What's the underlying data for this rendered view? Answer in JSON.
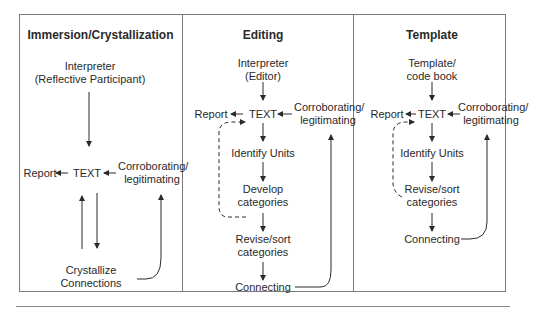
{
  "figure": {
    "panels": [
      {
        "title": "Immersion/Crystallization",
        "source_line1": "Interpreter",
        "source_line2": "(Reflective Participant)",
        "report": "Report",
        "text": "TEXT",
        "corroborating_line1": "Corroborating/",
        "corroborating_line2": "legitimating",
        "step_a_line1": "Crystallize",
        "step_a_line2": "Connections"
      },
      {
        "title": "Editing",
        "source_line1": "Interpreter",
        "source_line2": "(Editor)",
        "report": "Report",
        "text": "TEXT",
        "corroborating_line1": "Corroborating/",
        "corroborating_line2": "legitimating",
        "step_1": "Identify Units",
        "step_2_line1": "Develop",
        "step_2_line2": "categories",
        "step_3_line1": "Revise/sort",
        "step_3_line2": "categories",
        "step_4": "Connecting"
      },
      {
        "title": "Template",
        "source_line1": "Template/",
        "source_line2": "code book",
        "report": "Report",
        "text": "TEXT",
        "corroborating_line1": "Corroborating/",
        "corroborating_line2": "legitimating",
        "step_1": "Identify Units",
        "step_2_line1": "Revise/sort",
        "step_2_line2": "categories",
        "step_3": "Connecting"
      }
    ]
  }
}
